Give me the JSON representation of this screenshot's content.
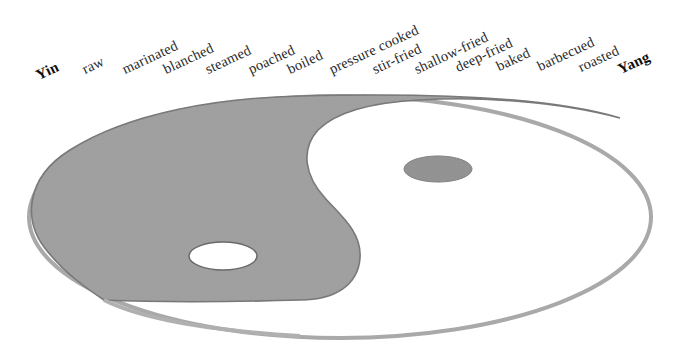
{
  "diagram": {
    "poles": {
      "yin": "Yin",
      "yang": "Yang"
    },
    "methods": [
      "raw",
      "marinated",
      "blanched",
      "steamed",
      "poached",
      "boiled",
      "pressure cooked",
      "stir-fried",
      "shallow-fried",
      "deep-fried",
      "baked",
      "barbecued",
      "roasted"
    ],
    "colors": {
      "yin_fill": "#9d9d9d",
      "yin_edge": "#6e6e6e",
      "yang_fill": "#ffffff",
      "outline": "#a8a8a8",
      "text": "#2a2a2a"
    },
    "symbol": {
      "type": "yin-yang",
      "yin_side": "left (dark grey)",
      "yang_side": "right (white)",
      "yin_eye": "white dot in dark region",
      "yang_eye": "dark dot in white region"
    }
  }
}
